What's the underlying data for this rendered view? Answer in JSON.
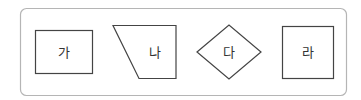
{
  "container": {
    "border_color": "#b5b5b5"
  },
  "shapes": [
    {
      "id": "ga",
      "type": "rectangle",
      "label": "가"
    },
    {
      "id": "na",
      "type": "trapezoid",
      "label": "나"
    },
    {
      "id": "da",
      "type": "diamond",
      "label": "다"
    },
    {
      "id": "ra",
      "type": "square",
      "label": "라"
    }
  ],
  "stroke_color": "#444444"
}
